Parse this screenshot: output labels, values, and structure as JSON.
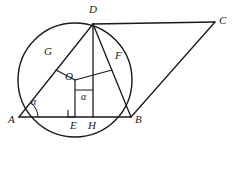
{
  "figure": {
    "background_color": "#ffffff",
    "stroke_color": "#1a1a1a",
    "label_color": "#1a1a1a"
  },
  "circle": {
    "center_x": 75,
    "center_y": 80,
    "radius": 57,
    "center_label": "O"
  },
  "points": {
    "A": {
      "label": "A",
      "x": 19,
      "y": 117,
      "label_x": 8,
      "label_y": 119
    },
    "B": {
      "label": "B",
      "x": 131,
      "y": 117,
      "label_x": 135,
      "label_y": 119
    },
    "C": {
      "label": "C",
      "x": 215,
      "y": 22,
      "label_x": 219,
      "label_y": 15
    },
    "D": {
      "label": "D",
      "x": 93,
      "y": 24,
      "label_x": 89,
      "label_y": 6
    },
    "E": {
      "label": "E",
      "x": 75,
      "y": 117,
      "label_x": 70,
      "label_y": 120
    },
    "F": {
      "label": "F",
      "x": 112,
      "y": 70,
      "label_x": 115,
      "label_y": 52
    },
    "G": {
      "label": "G",
      "x": 56,
      "y": 70,
      "label_x": 44,
      "label_y": 48
    },
    "H": {
      "label": "H",
      "x": 93,
      "y": 117,
      "label_x": 88,
      "label_y": 120
    },
    "O": {
      "label": "O",
      "x": 75,
      "y": 80,
      "label_x": 67,
      "label_y": 73
    }
  },
  "angles": [
    {
      "name": "angle-at-A",
      "symbol": "α",
      "label_x": 31,
      "label_y": 100,
      "arc_vertex": "A"
    },
    {
      "name": "angle-at-H",
      "symbol": "α",
      "label_x": 80,
      "label_y": 94,
      "arc_vertex": "H"
    }
  ],
  "segments": [
    {
      "name": "segment-AB",
      "from": "A",
      "to": "B"
    },
    {
      "name": "segment-AD",
      "from": "A",
      "to": "D"
    },
    {
      "name": "segment-DB",
      "from": "D",
      "to": "B"
    },
    {
      "name": "segment-DH",
      "from": "D",
      "to": "H"
    },
    {
      "name": "segment-DC",
      "from": "D",
      "to": "C"
    },
    {
      "name": "segment-BC",
      "from": "B",
      "to": "C"
    },
    {
      "name": "segment-OG",
      "from": "O",
      "to": "G"
    },
    {
      "name": "segment-OF",
      "from": "O",
      "to": "F"
    },
    {
      "name": "segment-OE",
      "from": "O",
      "to": "E"
    }
  ],
  "markers": {
    "right_angle_at_E": {
      "name": "right-angle-marker-E",
      "size": 7
    }
  }
}
